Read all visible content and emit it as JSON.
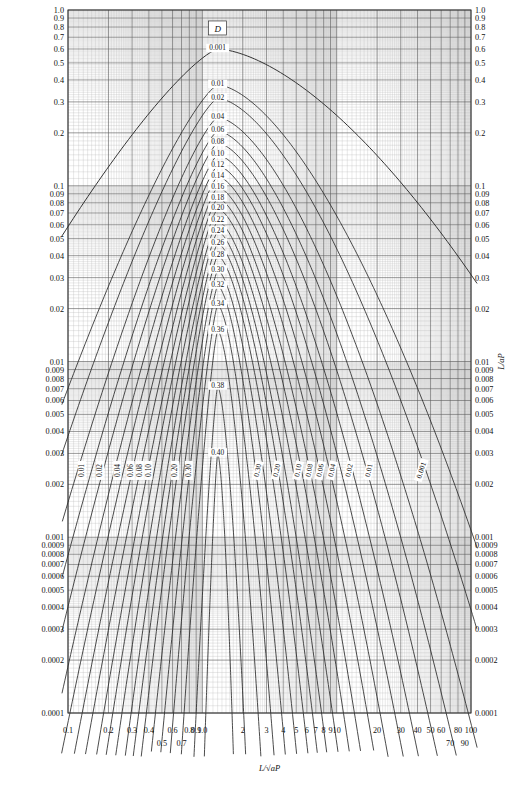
{
  "chart_data": {
    "type": "line",
    "title": "",
    "xlabel": "L/√aP",
    "ylabel": "L/aP",
    "legend_box_label": "D",
    "xscale": "log",
    "yscale": "log",
    "xlim": [
      0.1,
      100
    ],
    "ylim": [
      0.0001,
      1.0
    ],
    "grid": true,
    "legend_position": "top-center-box",
    "x_major_ticks": [
      "0.1",
      "0.2",
      "0.3",
      "0.4",
      "0.5",
      "0.6",
      "0.7",
      "0.8",
      "0.9",
      "1.0",
      "2",
      "3",
      "4",
      "5",
      "6",
      "7",
      "8",
      "9",
      "10",
      "20",
      "30",
      "40",
      "50",
      "60",
      "70",
      "80",
      "90",
      "100"
    ],
    "x_ticks_lower_row": [
      "0.5",
      "0.7",
      "70",
      "90"
    ],
    "y_major_ticks": [
      "1.0",
      "0.9",
      "0.8",
      "0.7",
      "0.6",
      "0.5",
      "0.4",
      "0.3",
      "0.2",
      "0.1",
      "0.09",
      "0.08",
      "0.07",
      "0.06",
      "0.05",
      "0.04",
      "0.03",
      "0.02",
      "0.01",
      "0.009",
      "0.008",
      "0.007",
      "0.006",
      "0.005",
      "0.004",
      "0.003",
      "0.002",
      "0.001",
      "0.0009",
      "0.0008",
      "0.0007",
      "0.0006",
      "0.0005",
      "0.0004",
      "0.0003",
      "0.0002",
      "0.0001"
    ],
    "contour_parameter": "D",
    "contours": [
      {
        "label": "0.001",
        "peak_x": 1.3,
        "peak_y": 0.6,
        "width": 2.7
      },
      {
        "label": "0.01",
        "peak_x": 1.3,
        "peak_y": 0.375,
        "width": 1.72
      },
      {
        "label": "0.02",
        "peak_x": 1.3,
        "peak_y": 0.315,
        "width": 1.56
      },
      {
        "label": "0.04",
        "peak_x": 1.3,
        "peak_y": 0.245,
        "width": 1.38
      },
      {
        "label": "0.06",
        "peak_x": 1.3,
        "peak_y": 0.205,
        "width": 1.26
      },
      {
        "label": "0.08",
        "peak_x": 1.3,
        "peak_y": 0.175,
        "width": 1.16
      },
      {
        "label": "0.10",
        "peak_x": 1.3,
        "peak_y": 0.15,
        "width": 1.06
      },
      {
        "label": "0.12",
        "peak_x": 1.3,
        "peak_y": 0.13,
        "width": 0.98
      },
      {
        "label": "0.14",
        "peak_x": 1.3,
        "peak_y": 0.113,
        "width": 0.9
      },
      {
        "label": "0.16",
        "peak_x": 1.3,
        "peak_y": 0.098,
        "width": 0.83
      },
      {
        "label": "0.18",
        "peak_x": 1.3,
        "peak_y": 0.085,
        "width": 0.76
      },
      {
        "label": "0.20",
        "peak_x": 1.3,
        "peak_y": 0.074,
        "width": 0.7
      },
      {
        "label": "0.22",
        "peak_x": 1.3,
        "peak_y": 0.063,
        "width": 0.64
      },
      {
        "label": "0.24",
        "peak_x": 1.3,
        "peak_y": 0.055,
        "width": 0.58
      },
      {
        "label": "0.26",
        "peak_x": 1.3,
        "peak_y": 0.047,
        "width": 0.53
      },
      {
        "label": "0.28",
        "peak_x": 1.3,
        "peak_y": 0.04,
        "width": 0.48
      },
      {
        "label": "0.30",
        "peak_x": 1.3,
        "peak_y": 0.033,
        "width": 0.42
      },
      {
        "label": "0.32",
        "peak_x": 1.3,
        "peak_y": 0.027,
        "width": 0.36
      },
      {
        "label": "0.34",
        "peak_x": 1.3,
        "peak_y": 0.021,
        "width": 0.3
      },
      {
        "label": "0.36",
        "peak_x": 1.3,
        "peak_y": 0.015,
        "width": 0.23
      },
      {
        "label": "0.38",
        "peak_x": 1.3,
        "peak_y": 0.0072,
        "width": 0.15
      },
      {
        "label": "0.40",
        "peak_x": 1.3,
        "peak_y": 0.003,
        "width": 0.085
      }
    ],
    "left_branch_labels": [
      "0.01",
      "0.02",
      "0.04",
      "0.06",
      "0.08",
      "0.10",
      "0.20",
      "0.30"
    ],
    "right_branch_labels": [
      "0.30",
      "0.20",
      "0.10",
      "0.08",
      "0.06",
      "0.04",
      "0.02",
      "0.01",
      "0.001"
    ],
    "annotations": [
      {
        "text": "0.001",
        "position": "apex"
      },
      {
        "text": "D",
        "position": "boxed-top"
      }
    ]
  }
}
